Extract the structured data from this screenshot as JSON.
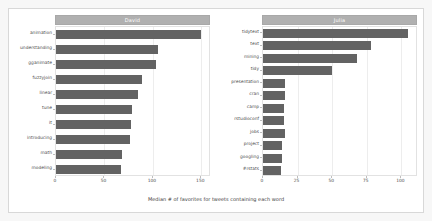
{
  "chart_data": {
    "type": "bar",
    "orientation": "horizontal",
    "title": "",
    "xlabel": "Median # of favorites for tweets containing each word",
    "ylabel": "",
    "grid": true,
    "legend": false,
    "facet_layout": "1x2",
    "panels": [
      {
        "name": "David",
        "strip_label": "David",
        "xlim": [
          0,
          160
        ],
        "xticks": [
          0,
          50,
          100,
          150
        ],
        "xticklabels": [
          "0",
          "50",
          "100",
          "150"
        ],
        "categories": [
          "animation",
          "understanding",
          "gganimate",
          "fuzzyjoin",
          "linear",
          "tune",
          "it",
          "introducing",
          "math",
          "modeling"
        ],
        "values": [
          150,
          105,
          103,
          89,
          85,
          78,
          77,
          76,
          68,
          67
        ]
      },
      {
        "name": "Julia",
        "strip_label": "Julia",
        "xlim": [
          0,
          112
        ],
        "xticks": [
          0,
          25,
          50,
          75,
          100
        ],
        "xticklabels": [
          "0",
          "25",
          "50",
          "75",
          "100"
        ],
        "categories": [
          "tidytext",
          "text",
          "mining",
          "tidy",
          "presentation",
          "cran",
          "camp",
          "rstudioconf",
          "jobs",
          "project",
          "googling",
          "#rstats"
        ],
        "values": [
          105,
          78,
          68,
          50,
          16,
          16,
          15,
          15,
          16,
          14,
          14,
          13
        ]
      }
    ]
  },
  "colors": {
    "bar": "#636363",
    "strip_background": "#b0b0b0",
    "strip_text": "#ffffff",
    "panel_background": "#ffffff",
    "gridline": "#ededed",
    "axis_text": "#4d4d4d",
    "device_background": "#f7f7f7",
    "frame_border": "#d8d8d8"
  }
}
